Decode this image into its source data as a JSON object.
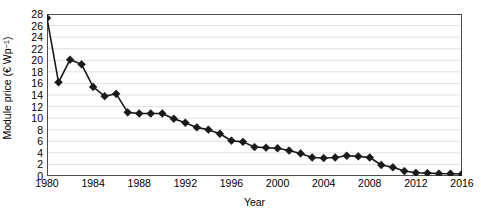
{
  "chart_data": {
    "type": "line",
    "title": "",
    "xlabel": "Year",
    "ylabel": "Module price (€ Wp⁻¹)",
    "ylabel_parts": {
      "text": "Module price (€ Wp",
      "sup": "−1",
      "tail": ")"
    },
    "xlim": [
      1980,
      2016
    ],
    "ylim": [
      0,
      28
    ],
    "y_ticks": [
      0,
      2,
      4,
      6,
      8,
      10,
      12,
      14,
      16,
      18,
      20,
      22,
      24,
      26,
      28
    ],
    "y_tick_labels": [
      "0",
      "2",
      "4",
      "6",
      "8",
      "10",
      "12",
      "14",
      "16",
      "18",
      "20",
      "22",
      "24",
      "26",
      "28"
    ],
    "x_ticks": [
      1980,
      1984,
      1988,
      1992,
      1996,
      2000,
      2004,
      2008,
      2012,
      2016
    ],
    "x_tick_labels": [
      "1980",
      "1984",
      "1988",
      "1992",
      "1996",
      "2000",
      "2004",
      "2008",
      "2012",
      "2016"
    ],
    "x_minor_tick_step": 1,
    "grid": {
      "horizontal": true,
      "vertical": false,
      "color": "#d9d9d9",
      "style": "solid"
    },
    "legend": {
      "visible": false,
      "position": "none"
    },
    "marker": {
      "shape": "diamond",
      "color": "#1a1a1a",
      "size": 5
    },
    "line": {
      "color": "#1a1a1a",
      "width": 1.6
    },
    "x": [
      1980,
      1981,
      1982,
      1983,
      1984,
      1985,
      1986,
      1987,
      1988,
      1989,
      1990,
      1991,
      1992,
      1993,
      1994,
      1995,
      1996,
      1997,
      1998,
      1999,
      2000,
      2001,
      2002,
      2003,
      2004,
      2005,
      2006,
      2007,
      2008,
      2009,
      2010,
      2011,
      2012,
      2013,
      2014,
      2015,
      2016
    ],
    "values": [
      27.3,
      16.2,
      20.1,
      19.3,
      15.4,
      13.8,
      14.2,
      11.0,
      10.8,
      10.8,
      10.8,
      9.9,
      9.2,
      8.4,
      8.0,
      7.3,
      6.1,
      5.9,
      5.0,
      4.9,
      4.8,
      4.4,
      3.9,
      3.2,
      3.1,
      3.2,
      3.5,
      3.4,
      3.2,
      1.9,
      1.5,
      0.85,
      0.55,
      0.5,
      0.42,
      0.4,
      0.35
    ],
    "series": [
      {
        "name": "Module price",
        "values": [
          27.3,
          16.2,
          20.1,
          19.3,
          15.4,
          13.8,
          14.2,
          11.0,
          10.8,
          10.8,
          10.8,
          9.9,
          9.2,
          8.4,
          8.0,
          7.3,
          6.1,
          5.9,
          5.0,
          4.9,
          4.8,
          4.4,
          3.9,
          3.2,
          3.1,
          3.2,
          3.5,
          3.4,
          3.2,
          1.9,
          1.5,
          0.85,
          0.55,
          0.5,
          0.42,
          0.4,
          0.35
        ]
      }
    ],
    "axis_color": "#4d4d4d",
    "background": "#ffffff"
  }
}
